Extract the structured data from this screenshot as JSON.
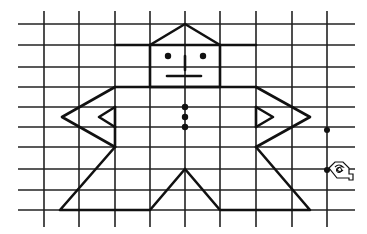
{
  "canvas": {
    "width": 367,
    "height": 234,
    "background": "#ffffff",
    "line_color": "#111111"
  },
  "grid": {
    "x_lines": [
      44,
      79,
      115,
      150,
      185,
      220,
      256,
      292,
      327
    ],
    "y_lines": [
      24,
      45,
      67,
      87,
      107,
      127,
      147,
      169,
      190,
      210
    ],
    "x_extent": [
      18,
      355
    ],
    "y_extent": [
      11,
      227
    ]
  },
  "figure": {
    "name": "robot-figure",
    "segments": [
      {
        "name": "hat-brim",
        "points": [
          [
            115,
            45
          ],
          [
            256,
            45
          ]
        ]
      },
      {
        "name": "hat-roof",
        "points": [
          [
            150,
            45
          ],
          [
            185,
            24
          ],
          [
            220,
            45
          ]
        ]
      },
      {
        "name": "head-box",
        "points": [
          [
            150,
            45
          ],
          [
            150,
            87
          ],
          [
            220,
            87
          ],
          [
            220,
            45
          ]
        ]
      },
      {
        "name": "mouth",
        "points": [
          [
            167,
            76
          ],
          [
            201,
            76
          ]
        ]
      },
      {
        "name": "nose",
        "points": [
          [
            185,
            56
          ],
          [
            185,
            70
          ]
        ]
      },
      {
        "name": "shoulders",
        "points": [
          [
            115,
            87
          ],
          [
            256,
            87
          ]
        ]
      },
      {
        "name": "left-arm-outer",
        "points": [
          [
            115,
            87
          ],
          [
            62,
            117
          ],
          [
            115,
            147
          ]
        ]
      },
      {
        "name": "left-arm-inner",
        "points": [
          [
            115,
            107
          ],
          [
            99,
            117
          ],
          [
            115,
            127
          ]
        ]
      },
      {
        "name": "left-torso",
        "points": [
          [
            115,
            107
          ],
          [
            115,
            127
          ]
        ]
      },
      {
        "name": "left-hip",
        "points": [
          [
            115,
            147
          ],
          [
            115,
            127
          ]
        ]
      },
      {
        "name": "right-arm-outer",
        "points": [
          [
            256,
            87
          ],
          [
            310,
            117
          ],
          [
            256,
            147
          ]
        ]
      },
      {
        "name": "right-arm-inner",
        "points": [
          [
            256,
            107
          ],
          [
            273,
            117
          ],
          [
            256,
            127
          ]
        ]
      },
      {
        "name": "right-torso",
        "points": [
          [
            256,
            107
          ],
          [
            256,
            127
          ]
        ]
      },
      {
        "name": "left-leg",
        "points": [
          [
            115,
            147
          ],
          [
            60,
            210
          ],
          [
            150,
            210
          ],
          [
            185,
            169
          ],
          [
            220,
            210
          ],
          [
            310,
            210
          ],
          [
            256,
            147
          ]
        ]
      },
      {
        "name": "waist",
        "points": [
          [
            115,
            147
          ],
          [
            115,
            147
          ]
        ]
      }
    ],
    "dots": [
      {
        "name": "left-eye",
        "x": 168,
        "y": 56,
        "r": 3.2
      },
      {
        "name": "right-eye",
        "x": 203,
        "y": 56,
        "r": 3.2
      },
      {
        "name": "button-1",
        "x": 185,
        "y": 107,
        "r": 3.2
      },
      {
        "name": "button-2",
        "x": 185,
        "y": 117,
        "r": 3.2
      },
      {
        "name": "button-3",
        "x": 185,
        "y": 127,
        "r": 3.2
      },
      {
        "name": "marker-point",
        "x": 327,
        "y": 130,
        "r": 3
      },
      {
        "name": "cursor-point",
        "x": 327,
        "y": 170,
        "r": 3
      }
    ]
  },
  "cursor": {
    "name": "hand-pointer-icon",
    "x": 329,
    "y": 160
  }
}
